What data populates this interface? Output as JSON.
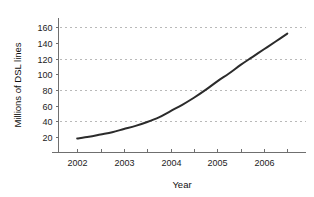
{
  "chart_data": {
    "type": "line",
    "title": "",
    "xlabel": "Year",
    "ylabel": "Millions of DSL lines",
    "xlim": [
      2001.6,
      2006.9
    ],
    "ylim": [
      0,
      172
    ],
    "grid": true,
    "grid_axis": "y",
    "grid_values": [
      40,
      80,
      120,
      160
    ],
    "legend": "none",
    "x_tick_labels": [
      "2002",
      "2003",
      "2004",
      "2005",
      "2006"
    ],
    "x_tick_values": [
      2002,
      2003,
      2004,
      2005,
      2006
    ],
    "x_minor_tick_values": [
      2002.5,
      2003.5,
      2004.5,
      2005.5,
      2006.5
    ],
    "y_tick_labels": [
      "20",
      "40",
      "60",
      "80",
      "100",
      "120",
      "140",
      "160"
    ],
    "y_tick_values": [
      20,
      40,
      60,
      80,
      100,
      120,
      140,
      160
    ],
    "series": [
      {
        "name": "DSL lines",
        "color": "#2b2b2b",
        "x": [
          2002.0,
          2002.25,
          2002.5,
          2002.75,
          2003.0,
          2003.25,
          2003.5,
          2003.75,
          2004.0,
          2004.25,
          2004.5,
          2004.75,
          2005.0,
          2005.25,
          2005.5,
          2005.75,
          2006.0,
          2006.25,
          2006.5
        ],
        "values": [
          18,
          20,
          23,
          26,
          30,
          34,
          39,
          45,
          53,
          61,
          70,
          80,
          91,
          101,
          112,
          122,
          132,
          142,
          152
        ]
      }
    ]
  },
  "axes": {
    "y_title": "Millions of DSL lines",
    "x_title": "Year"
  }
}
